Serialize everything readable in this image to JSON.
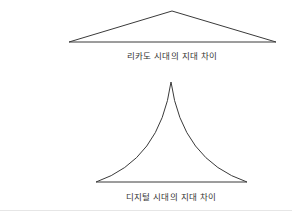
{
  "diagram": {
    "shapes": [
      {
        "id": "ricardo-era",
        "type": "flat-triangle",
        "label": "리카도 시대의 지대 차이",
        "points": [
          [
            69,
            42
          ],
          [
            172,
            11
          ],
          [
            276,
            42
          ]
        ]
      },
      {
        "id": "digital-era",
        "type": "concave-peak-triangle",
        "label": "디지털 시대의 지대 차이",
        "apex": [
          171,
          82
        ],
        "base": [
          [
            96,
            182
          ],
          [
            247,
            182
          ]
        ]
      }
    ],
    "colors": {
      "stroke": "#3a3a3a",
      "text": "#333333",
      "divider": "#e6e6e6"
    }
  }
}
